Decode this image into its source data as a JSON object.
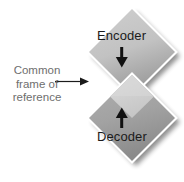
{
  "figure": {
    "width": 184,
    "height": 182,
    "background_color": "#ffffff"
  },
  "annotation": {
    "name": "common-frame-of-reference",
    "lines": [
      "Common",
      "frame of",
      "reference"
    ],
    "text_color": "#6e6e6e",
    "arrow_color": "#1b1b1b",
    "arrow_direction": "right",
    "points_to": "shared-overlap-region"
  },
  "shapes": {
    "encoder": {
      "label": "Encoder",
      "shape": "diamond",
      "fill_top": "#c9c9c9",
      "fill_bottom": "#9e9e9e",
      "label_color": "#1b1b1b",
      "arrow": {
        "name": "down-arrow",
        "direction": "down",
        "color": "#111111"
      }
    },
    "decoder": {
      "label": "Decoder",
      "shape": "diamond",
      "fill_top": "#a8a8a8",
      "fill_bottom": "#8e8e8e",
      "label_color": "#1b1b1b",
      "arrow": {
        "name": "up-arrow",
        "direction": "up",
        "color": "#111111"
      }
    },
    "overlap": {
      "name": "shared-overlap-region",
      "fill": "#d2d2d2",
      "description": "Common frame of reference"
    }
  },
  "style": {
    "shadow_color": "#bdbdbd",
    "edge_highlight": "#ffffff"
  }
}
